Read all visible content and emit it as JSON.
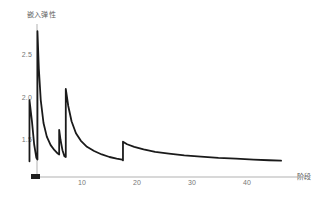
{
  "page": {
    "top_fragment": "·  ·   ··   ·· ·   · ·· ···              ····"
  },
  "chart_data": {
    "type": "line",
    "title": "",
    "subtitle": "",
    "xlabel": "阶段",
    "ylabel": "嵌入弹性",
    "xlim": [
      0,
      47
    ],
    "ylim": [
      1.15,
      2.85
    ],
    "grid": false,
    "legend": null,
    "xticks": [
      10,
      20,
      30,
      40
    ],
    "xticklabels": [
      "10",
      "20",
      "30",
      "40"
    ],
    "yticks": [
      1.5,
      2.0,
      2.5
    ],
    "yticklabels": [
      "1.5",
      "2.0",
      "2.5"
    ],
    "series": [
      {
        "name": "嵌入弹性",
        "color": "#1a1a1a",
        "linewidth": 1.8,
        "description": "sawtooth relaxation curve: sharp vertical rises followed by exponential decays, overall decaying envelope",
        "x": [
          0.45,
          0.45,
          0.9,
          1.3,
          1.7,
          1.9,
          1.9,
          2.15,
          2.5,
          3.0,
          3.6,
          4.3,
          5.0,
          5.6,
          5.85,
          5.85,
          6.1,
          6.45,
          6.8,
          7.05,
          7.05,
          7.5,
          8.1,
          8.9,
          9.8,
          10.9,
          12.2,
          13.6,
          15.0,
          16.3,
          17.3,
          17.45,
          17.45,
          18.2,
          19.5,
          21.2,
          23.3,
          25.8,
          28.6,
          31.6,
          34.8,
          38.0,
          41.2,
          44.0,
          46.2
        ],
        "y": [
          1.25,
          1.97,
          1.72,
          1.45,
          1.29,
          1.27,
          2.78,
          2.34,
          1.97,
          1.7,
          1.54,
          1.44,
          1.38,
          1.34,
          1.33,
          1.62,
          1.5,
          1.38,
          1.31,
          1.3,
          2.1,
          1.9,
          1.72,
          1.58,
          1.49,
          1.42,
          1.37,
          1.33,
          1.3,
          1.28,
          1.27,
          1.26,
          1.48,
          1.45,
          1.42,
          1.39,
          1.36,
          1.34,
          1.32,
          1.305,
          1.29,
          1.28,
          1.27,
          1.262,
          1.257
        ]
      }
    ],
    "axis_color": "#9a9a9a",
    "tick_color": "#777777",
    "background": "#ffffff"
  }
}
